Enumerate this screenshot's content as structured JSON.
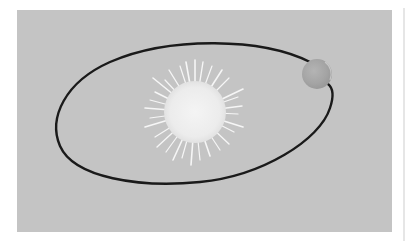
{
  "figure": {
    "background_color": "#c4c4c4",
    "page_color": "#ffffff",
    "orbit": {
      "shape": "ellipse",
      "stroke_color": "#1a1a1a",
      "stroke_width": 2.4
    },
    "sun": {
      "label": "sun",
      "color": "#f2f2f2",
      "ray_color": "#f7f7f7"
    },
    "planet": {
      "label": "planet",
      "color": "#a8a8a8"
    }
  }
}
